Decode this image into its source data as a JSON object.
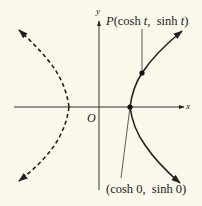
{
  "diagram": {
    "axes": {
      "x_label": "x",
      "y_label": "y",
      "origin_label": "O"
    },
    "point_P": {
      "prefix": "P",
      "open": "(",
      "x_expr_fn": "cosh",
      "x_expr_var": "t",
      "sep": ",",
      "y_expr_fn": "sinh",
      "y_expr_var": "t",
      "close": ")"
    },
    "vertex_label": {
      "text": "(cosh 0,  sinh 0)"
    },
    "branches": [
      {
        "name": "right-branch",
        "style": "solid"
      },
      {
        "name": "left-branch",
        "style": "dashed"
      }
    ],
    "colors": {
      "background": "#fbf8ec",
      "ink": "#222222"
    }
  }
}
